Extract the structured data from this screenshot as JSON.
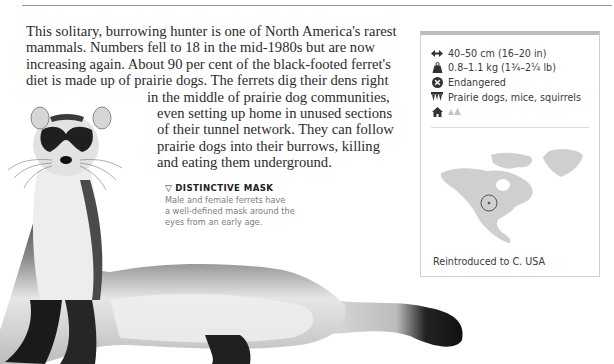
{
  "page": {
    "heading_fragment": "… g  p …"
  },
  "article": {
    "body_lines": [
      "This solitary, burrowing hunter is one of North America's rarest",
      "mammals. Numbers fell to 18 in the mid-1980s but are now",
      "increasing again. About 90 per cent of the black-footed ferret's",
      "diet is made up of prairie dogs. The ferrets dig their dens right",
      "in the middle of prairie dog communities,",
      "even setting up home in unused sections",
      "of their tunnel network. They can follow",
      "prairie dogs into their burrows, killing",
      "and eating them underground."
    ]
  },
  "caption": {
    "marker": "▽",
    "title": "DISTINCTIVE MASK",
    "lines": [
      "Male and female ferrets have",
      "a well-defined mask around the",
      "eyes from an early age."
    ]
  },
  "fact_box": {
    "facts": [
      {
        "icon": "length-arrows-icon",
        "text": "40–50 cm (16–20 in)"
      },
      {
        "icon": "weight-icon",
        "text": "0.8–1.1 kg (1¾–2¼ lb)"
      },
      {
        "icon": "endangered-status-icon",
        "text": "Endangered"
      },
      {
        "icon": "diet-teeth-icon",
        "text": "Prairie dogs, mice, squirrels"
      },
      {
        "icon": "habitat-home-icon",
        "text": ""
      }
    ],
    "map_caption": "Reintroduced to C. USA",
    "colors": {
      "border": "#cfcfcf",
      "top_border": "#bdbdbd",
      "map_land": "#cfcfcf",
      "marker": "#555555"
    }
  }
}
